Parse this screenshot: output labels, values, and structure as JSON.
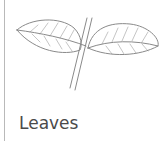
{
  "card": {
    "caption": "Leaves",
    "illustration": "leaves-drawing",
    "colors": {
      "line": "#8a8a8a",
      "text": "#4a4a4a",
      "border": "#b9b9b9"
    }
  }
}
